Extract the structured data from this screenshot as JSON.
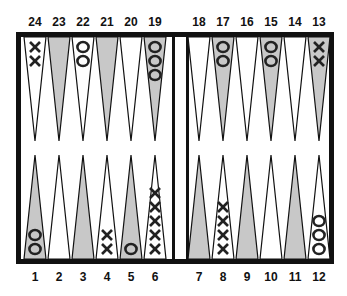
{
  "board": {
    "title": "Backgammon board position",
    "colors": {
      "border": "#111111",
      "dark_point": "#c8c8c8",
      "light_point": "#ffffff",
      "checker": "#222222"
    },
    "top_labels": [
      "24",
      "23",
      "22",
      "21",
      "20",
      "19",
      "18",
      "17",
      "16",
      "15",
      "14",
      "13"
    ],
    "bottom_labels": [
      "1",
      "2",
      "3",
      "4",
      "5",
      "6",
      "7",
      "8",
      "9",
      "10",
      "11",
      "12"
    ],
    "points": [
      {
        "num": 24,
        "row": "top",
        "shade": "light",
        "checker": "X",
        "count": 2
      },
      {
        "num": 23,
        "row": "top",
        "shade": "dark",
        "checker": "",
        "count": 0
      },
      {
        "num": 22,
        "row": "top",
        "shade": "light",
        "checker": "O",
        "count": 2
      },
      {
        "num": 21,
        "row": "top",
        "shade": "dark",
        "checker": "",
        "count": 0
      },
      {
        "num": 20,
        "row": "top",
        "shade": "light",
        "checker": "",
        "count": 0
      },
      {
        "num": 19,
        "row": "top",
        "shade": "dark",
        "checker": "O",
        "count": 3
      },
      {
        "num": 18,
        "row": "top",
        "shade": "light",
        "checker": "",
        "count": 0
      },
      {
        "num": 17,
        "row": "top",
        "shade": "dark",
        "checker": "O",
        "count": 2
      },
      {
        "num": 16,
        "row": "top",
        "shade": "light",
        "checker": "",
        "count": 0
      },
      {
        "num": 15,
        "row": "top",
        "shade": "dark",
        "checker": "O",
        "count": 2
      },
      {
        "num": 14,
        "row": "top",
        "shade": "light",
        "checker": "",
        "count": 0
      },
      {
        "num": 13,
        "row": "top",
        "shade": "dark",
        "checker": "X",
        "count": 2
      },
      {
        "num": 1,
        "row": "bottom",
        "shade": "dark",
        "checker": "O",
        "count": 2
      },
      {
        "num": 2,
        "row": "bottom",
        "shade": "light",
        "checker": "",
        "count": 0
      },
      {
        "num": 3,
        "row": "bottom",
        "shade": "dark",
        "checker": "",
        "count": 0
      },
      {
        "num": 4,
        "row": "bottom",
        "shade": "light",
        "checker": "X",
        "count": 2
      },
      {
        "num": 5,
        "row": "bottom",
        "shade": "dark",
        "checker": "O",
        "count": 1
      },
      {
        "num": 6,
        "row": "bottom",
        "shade": "light",
        "checker": "X",
        "count": 5
      },
      {
        "num": 7,
        "row": "bottom",
        "shade": "dark",
        "checker": "",
        "count": 0
      },
      {
        "num": 8,
        "row": "bottom",
        "shade": "light",
        "checker": "X",
        "count": 4
      },
      {
        "num": 9,
        "row": "bottom",
        "shade": "dark",
        "checker": "",
        "count": 0
      },
      {
        "num": 10,
        "row": "bottom",
        "shade": "light",
        "checker": "",
        "count": 0
      },
      {
        "num": 11,
        "row": "bottom",
        "shade": "dark",
        "checker": "",
        "count": 0
      },
      {
        "num": 12,
        "row": "bottom",
        "shade": "light",
        "checker": "O",
        "count": 3
      }
    ]
  }
}
